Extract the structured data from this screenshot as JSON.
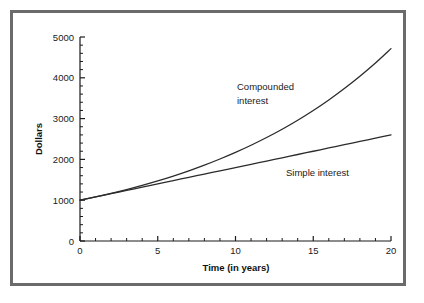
{
  "chart_data": {
    "type": "line",
    "title": "",
    "xlabel": "Time (in years)",
    "ylabel": "Dollars",
    "xlim": [
      0,
      20
    ],
    "ylim": [
      0,
      5000
    ],
    "grid": false,
    "legend_position": "inline-annotation",
    "x_ticks": [
      0,
      5,
      10,
      15,
      20
    ],
    "x_tick_labels": [
      "0",
      "5",
      "10",
      "15",
      "20"
    ],
    "x_minor_step": 1,
    "y_ticks": [
      0,
      1000,
      2000,
      3000,
      4000,
      5000
    ],
    "y_tick_labels": [
      "0",
      "1000",
      "2000",
      "3000",
      "4000",
      "5000"
    ],
    "y_minor_step": 200,
    "x": [
      0,
      1,
      2,
      3,
      4,
      5,
      6,
      7,
      8,
      9,
      10,
      11,
      12,
      13,
      14,
      15,
      16,
      17,
      18,
      19,
      20
    ],
    "series": [
      {
        "name": "Compounded interest",
        "annotation": "Compounded\ninterest",
        "annotation_line1": "Compounded",
        "annotation_line2": "interest",
        "color": "#2b2b2b",
        "values": [
          1000,
          1081,
          1168,
          1262,
          1364,
          1474,
          1593,
          1721,
          1860,
          2010,
          2172,
          2347,
          2536,
          2740,
          2961,
          3200,
          3458,
          3737,
          4038,
          4363,
          4715
        ]
      },
      {
        "name": "Simple interest",
        "annotation": "Simple interest",
        "annotation_line1": "Simple interest",
        "color": "#2b2b2b",
        "values": [
          1000,
          1080,
          1160,
          1240,
          1320,
          1400,
          1480,
          1560,
          1640,
          1720,
          1800,
          1880,
          1960,
          2040,
          2120,
          2200,
          2280,
          2360,
          2440,
          2520,
          2600
        ]
      }
    ]
  },
  "figure": {
    "border_color": "#6b6b6b",
    "background": "#ffffff",
    "axis_color": "#1a1a1a"
  }
}
